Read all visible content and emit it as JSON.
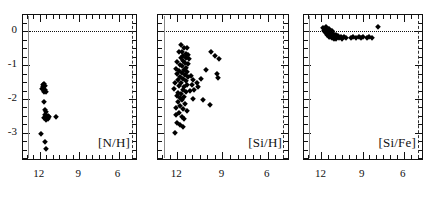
{
  "figure": {
    "background": "#ffffff",
    "marker_color": "#000000",
    "reference_line_color": "#111111",
    "vertical_solid_line_color": "#8a8a8a",
    "vertical_dashed_line_color": "#333333"
  },
  "chart_data": [
    {
      "type": "scatter",
      "title": "",
      "panel_label": "[N/H]",
      "xlabel": "",
      "ylabel": "",
      "xlim": [
        13.2,
        4.6
      ],
      "ylim": [
        -3.8,
        0.45
      ],
      "xticks": [
        12,
        9,
        6
      ],
      "xtick_labels": [
        "12",
        "9",
        "6"
      ],
      "yticks": [
        0,
        -1,
        -2,
        -3
      ],
      "ytick_labels": [
        "0",
        "-1",
        "-2",
        "-3"
      ],
      "grid": false,
      "legend": "none",
      "annotations": [
        {
          "kind": "hline",
          "y": 0,
          "style": "dotted"
        },
        {
          "kind": "vline",
          "x": 12.9,
          "style": "solid",
          "color": "#8a8a8a"
        },
        {
          "kind": "vline",
          "x": 5.0,
          "style": "dashed",
          "color": "#333333"
        }
      ],
      "points": [
        {
          "x": 11.72,
          "y": -1.58
        },
        {
          "x": 11.6,
          "y": -1.62
        },
        {
          "x": 11.66,
          "y": -1.55
        },
        {
          "x": 11.78,
          "y": -1.64
        },
        {
          "x": 11.62,
          "y": -1.72
        },
        {
          "x": 11.52,
          "y": -1.8
        },
        {
          "x": 11.7,
          "y": -1.78
        },
        {
          "x": 11.8,
          "y": -1.7
        },
        {
          "x": 11.64,
          "y": -2.1
        },
        {
          "x": 11.5,
          "y": -2.38
        },
        {
          "x": 11.62,
          "y": -2.33
        },
        {
          "x": 11.56,
          "y": -2.52
        },
        {
          "x": 11.46,
          "y": -2.56
        },
        {
          "x": 11.4,
          "y": -2.5
        },
        {
          "x": 11.66,
          "y": -2.56
        },
        {
          "x": 11.52,
          "y": -2.62
        },
        {
          "x": 11.38,
          "y": -2.6
        },
        {
          "x": 11.6,
          "y": -2.46
        },
        {
          "x": 11.3,
          "y": -2.53
        },
        {
          "x": 10.78,
          "y": -2.52
        },
        {
          "x": 11.92,
          "y": -3.04
        },
        {
          "x": 11.58,
          "y": -3.28
        },
        {
          "x": 11.55,
          "y": -3.48
        }
      ]
    },
    {
      "type": "scatter",
      "title": "",
      "panel_label": "[Si/H]",
      "xlabel": "",
      "ylabel": "",
      "xlim": [
        13.2,
        4.6
      ],
      "ylim": [
        -3.8,
        0.45
      ],
      "xticks": [
        12,
        9,
        6
      ],
      "xtick_labels": [
        "12",
        "9",
        "6"
      ],
      "yticks": [
        0,
        -1,
        -2,
        -3
      ],
      "ytick_labels": [
        "0",
        "-1",
        "-2",
        "-3"
      ],
      "grid": false,
      "legend": "none",
      "annotations": [
        {
          "kind": "hline",
          "y": 0,
          "style": "dotted"
        },
        {
          "kind": "vline",
          "x": 12.9,
          "style": "solid",
          "color": "#8a8a8a"
        },
        {
          "kind": "vline",
          "x": 5.0,
          "style": "dashed",
          "color": "#333333"
        }
      ],
      "points": [
        {
          "x": 11.74,
          "y": -0.42
        },
        {
          "x": 11.52,
          "y": -0.5
        },
        {
          "x": 11.34,
          "y": -0.48
        },
        {
          "x": 11.86,
          "y": -0.6
        },
        {
          "x": 11.66,
          "y": -0.62
        },
        {
          "x": 11.44,
          "y": -0.66
        },
        {
          "x": 11.28,
          "y": -0.7
        },
        {
          "x": 11.58,
          "y": -0.74
        },
        {
          "x": 11.4,
          "y": -0.78
        },
        {
          "x": 11.76,
          "y": -0.8
        },
        {
          "x": 11.2,
          "y": -0.82
        },
        {
          "x": 11.62,
          "y": -0.88
        },
        {
          "x": 12.0,
          "y": -0.92
        },
        {
          "x": 11.48,
          "y": -0.94
        },
        {
          "x": 11.3,
          "y": -0.96
        },
        {
          "x": 11.84,
          "y": -1.0
        },
        {
          "x": 11.66,
          "y": -1.04
        },
        {
          "x": 11.42,
          "y": -1.08
        },
        {
          "x": 12.1,
          "y": -1.1
        },
        {
          "x": 11.56,
          "y": -1.14
        },
        {
          "x": 11.88,
          "y": -1.18
        },
        {
          "x": 11.36,
          "y": -1.2
        },
        {
          "x": 11.7,
          "y": -1.24
        },
        {
          "x": 12.02,
          "y": -1.26
        },
        {
          "x": 11.5,
          "y": -1.3
        },
        {
          "x": 11.8,
          "y": -1.34
        },
        {
          "x": 11.26,
          "y": -1.36
        },
        {
          "x": 11.6,
          "y": -1.4
        },
        {
          "x": 11.94,
          "y": -1.44
        },
        {
          "x": 11.44,
          "y": -1.48
        },
        {
          "x": 12.12,
          "y": -1.52
        },
        {
          "x": 11.72,
          "y": -1.54
        },
        {
          "x": 11.34,
          "y": -1.58
        },
        {
          "x": 11.86,
          "y": -1.62
        },
        {
          "x": 11.56,
          "y": -1.66
        },
        {
          "x": 12.2,
          "y": -1.7
        },
        {
          "x": 11.64,
          "y": -1.74
        },
        {
          "x": 11.4,
          "y": -1.78
        },
        {
          "x": 11.92,
          "y": -1.82
        },
        {
          "x": 11.74,
          "y": -1.86
        },
        {
          "x": 12.04,
          "y": -1.9
        },
        {
          "x": 11.52,
          "y": -1.94
        },
        {
          "x": 11.82,
          "y": -1.98
        },
        {
          "x": 11.66,
          "y": -2.04
        },
        {
          "x": 11.96,
          "y": -2.1
        },
        {
          "x": 11.48,
          "y": -2.14
        },
        {
          "x": 11.78,
          "y": -2.2
        },
        {
          "x": 12.06,
          "y": -2.26
        },
        {
          "x": 11.6,
          "y": -2.3
        },
        {
          "x": 11.34,
          "y": -2.34
        },
        {
          "x": 11.88,
          "y": -2.4
        },
        {
          "x": 12.1,
          "y": -2.46
        },
        {
          "x": 11.7,
          "y": -2.52
        },
        {
          "x": 11.52,
          "y": -2.58
        },
        {
          "x": 12.04,
          "y": -2.72
        },
        {
          "x": 11.82,
          "y": -2.78
        },
        {
          "x": 11.58,
          "y": -2.82
        },
        {
          "x": 12.12,
          "y": -3.0
        },
        {
          "x": 11.1,
          "y": -1.32
        },
        {
          "x": 10.92,
          "y": -1.44
        },
        {
          "x": 11.04,
          "y": -1.6
        },
        {
          "x": 10.86,
          "y": -1.72
        },
        {
          "x": 11.14,
          "y": -1.76
        },
        {
          "x": 10.98,
          "y": -2.0
        },
        {
          "x": 10.7,
          "y": -1.52
        },
        {
          "x": 10.62,
          "y": -1.64
        },
        {
          "x": 10.44,
          "y": -1.4
        },
        {
          "x": 10.26,
          "y": -2.02
        },
        {
          "x": 10.08,
          "y": -1.14
        },
        {
          "x": 9.78,
          "y": -0.62
        },
        {
          "x": 9.52,
          "y": -0.74
        },
        {
          "x": 9.2,
          "y": -0.82
        },
        {
          "x": 9.36,
          "y": -1.26
        },
        {
          "x": 9.28,
          "y": -1.38
        },
        {
          "x": 9.8,
          "y": -2.18
        }
      ]
    },
    {
      "type": "scatter",
      "title": "",
      "panel_label": "[Si/Fe]",
      "xlabel": "",
      "ylabel": "",
      "xlim": [
        13.2,
        4.6
      ],
      "ylim": [
        -3.8,
        0.45
      ],
      "xticks": [
        12,
        9,
        6
      ],
      "xtick_labels": [
        "12",
        "9",
        "6"
      ],
      "yticks": [
        0,
        -1,
        -2,
        -3
      ],
      "ytick_labels": [
        "0",
        "-1",
        "-2",
        "-3"
      ],
      "grid": false,
      "legend": "none",
      "annotations": [
        {
          "kind": "hline",
          "y": 0,
          "style": "dotted"
        },
        {
          "kind": "vline",
          "x": 12.9,
          "style": "solid",
          "color": "#8a8a8a"
        },
        {
          "kind": "vline",
          "x": 5.0,
          "style": "dashed",
          "color": "#333333"
        }
      ],
      "points": [
        {
          "x": 11.9,
          "y": 0.1
        },
        {
          "x": 11.78,
          "y": 0.06
        },
        {
          "x": 11.84,
          "y": 0.02
        },
        {
          "x": 11.7,
          "y": 0.12
        },
        {
          "x": 11.62,
          "y": 0.04
        },
        {
          "x": 11.74,
          "y": -0.02
        },
        {
          "x": 11.56,
          "y": 0.0
        },
        {
          "x": 11.66,
          "y": -0.06
        },
        {
          "x": 11.5,
          "y": -0.08
        },
        {
          "x": 11.6,
          "y": -0.12
        },
        {
          "x": 11.44,
          "y": 0.06
        },
        {
          "x": 11.38,
          "y": -0.04
        },
        {
          "x": 11.48,
          "y": -0.16
        },
        {
          "x": 11.32,
          "y": -0.1
        },
        {
          "x": 11.26,
          "y": 0.02
        },
        {
          "x": 11.36,
          "y": -0.18
        },
        {
          "x": 11.2,
          "y": -0.06
        },
        {
          "x": 11.14,
          "y": -0.14
        },
        {
          "x": 11.24,
          "y": -0.2
        },
        {
          "x": 11.08,
          "y": -0.1
        },
        {
          "x": 11.0,
          "y": -0.16
        },
        {
          "x": 11.1,
          "y": -0.22
        },
        {
          "x": 10.94,
          "y": -0.12
        },
        {
          "x": 10.86,
          "y": -0.18
        },
        {
          "x": 10.96,
          "y": -0.24
        },
        {
          "x": 10.78,
          "y": -0.14
        },
        {
          "x": 10.7,
          "y": -0.2
        },
        {
          "x": 10.6,
          "y": -0.16
        },
        {
          "x": 10.48,
          "y": -0.22
        },
        {
          "x": 10.36,
          "y": -0.18
        },
        {
          "x": 10.22,
          "y": -0.2
        },
        {
          "x": 9.86,
          "y": -0.2
        },
        {
          "x": 9.7,
          "y": -0.18
        },
        {
          "x": 9.5,
          "y": -0.2
        },
        {
          "x": 9.3,
          "y": -0.16
        },
        {
          "x": 9.1,
          "y": -0.2
        },
        {
          "x": 8.94,
          "y": -0.18
        },
        {
          "x": 8.7,
          "y": -0.2
        },
        {
          "x": 8.54,
          "y": -0.18
        },
        {
          "x": 8.3,
          "y": -0.2
        },
        {
          "x": 7.9,
          "y": 0.14
        }
      ]
    }
  ]
}
